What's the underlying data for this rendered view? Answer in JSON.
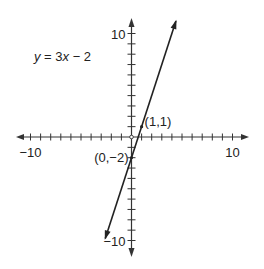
{
  "chart_data": {
    "type": "line",
    "title": "y = 3x − 2",
    "equation": {
      "lhs": "y",
      "rhs_prefix": " = 3",
      "var": "x",
      "rhs_suffix": " − 2"
    },
    "xlabel": "",
    "ylabel": "",
    "xlim": [
      -10,
      10
    ],
    "ylim": [
      -10,
      10
    ],
    "x_tick_labels": [
      {
        "value": -10,
        "label": "−10"
      },
      {
        "value": 10,
        "label": "10"
      }
    ],
    "y_tick_labels": [
      {
        "value": 10,
        "label": "10"
      },
      {
        "value": -10,
        "label": "−10"
      }
    ],
    "tick_step": 1,
    "grid": false,
    "series": [
      {
        "name": "y = 3x − 2",
        "slope": 3,
        "intercept": -2,
        "x": [
          -2.6,
          4.4
        ],
        "y": [
          -9.8,
          11.2
        ]
      }
    ],
    "annotations": [
      {
        "point": [
          1,
          1
        ],
        "label": "(1,1)"
      },
      {
        "point": [
          0,
          -2
        ],
        "label": "(0,−2)"
      }
    ],
    "line_color": "#222222",
    "axis_color": "#333333"
  }
}
